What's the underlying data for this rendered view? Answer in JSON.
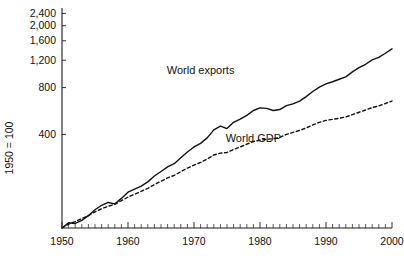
{
  "chart_data": {
    "type": "line",
    "title": "",
    "xlabel": "",
    "ylabel": "1950 = 100",
    "yscale": "log",
    "ylim": [
      100,
      2600
    ],
    "xlim": [
      1950,
      2000
    ],
    "grid": false,
    "legend_position": "inline-annotation",
    "ytick_labels": [
      "2,400",
      "2,000",
      "1,600",
      "1,200",
      "800",
      "400"
    ],
    "ytick_values": [
      2400,
      2000,
      1600,
      1200,
      800,
      400
    ],
    "xtick_labels": [
      "1950",
      "1960",
      "1970",
      "1980",
      "1990",
      "2000"
    ],
    "xtick_values": [
      1950,
      1960,
      1970,
      1980,
      1990,
      2000
    ],
    "x_minor_tick_step": 1,
    "annotations": [
      {
        "text": "World exports",
        "x": 1971,
        "y": 980
      },
      {
        "text": "World GDP",
        "x": 1979,
        "y": 360
      }
    ],
    "series": [
      {
        "name": "World exports",
        "style": "solid",
        "color": "#111111",
        "x": [
          1950,
          1951,
          1952,
          1953,
          1954,
          1955,
          1956,
          1957,
          1958,
          1959,
          1960,
          1961,
          1962,
          1963,
          1964,
          1965,
          1966,
          1967,
          1968,
          1969,
          1970,
          1971,
          1972,
          1973,
          1974,
          1975,
          1976,
          1977,
          1978,
          1979,
          1980,
          1981,
          1982,
          1983,
          1984,
          1985,
          1986,
          1987,
          1988,
          1989,
          1990,
          1991,
          1992,
          1993,
          1994,
          1995,
          1996,
          1997,
          1998,
          1999,
          2000
        ],
        "values": [
          100,
          108,
          107,
          112,
          120,
          131,
          140,
          146,
          143,
          155,
          170,
          178,
          186,
          198,
          216,
          231,
          247,
          259,
          283,
          308,
          332,
          350,
          380,
          428,
          452,
          436,
          478,
          502,
          530,
          570,
          592,
          588,
          570,
          578,
          612,
          628,
          655,
          700,
          755,
          805,
          845,
          872,
          905,
          938,
          1010,
          1075,
          1130,
          1205,
          1250,
          1330,
          1420
        ]
      },
      {
        "name": "World GDP",
        "style": "dashed",
        "color": "#111111",
        "x": [
          1950,
          1951,
          1952,
          1953,
          1954,
          1955,
          1956,
          1957,
          1958,
          1959,
          1960,
          1961,
          1962,
          1963,
          1964,
          1965,
          1966,
          1967,
          1968,
          1969,
          1970,
          1971,
          1972,
          1973,
          1974,
          1975,
          1976,
          1977,
          1978,
          1979,
          1980,
          1981,
          1982,
          1983,
          1984,
          1985,
          1986,
          1987,
          1988,
          1989,
          1990,
          1991,
          1992,
          1993,
          1994,
          1995,
          1996,
          1997,
          1998,
          1999,
          2000
        ],
        "values": [
          100,
          106,
          110,
          115,
          120,
          127,
          133,
          138,
          142,
          150,
          158,
          165,
          172,
          180,
          190,
          200,
          210,
          218,
          230,
          243,
          254,
          264,
          278,
          295,
          303,
          306,
          320,
          332,
          346,
          360,
          367,
          372,
          375,
          383,
          400,
          412,
          424,
          440,
          460,
          478,
          492,
          500,
          508,
          518,
          536,
          555,
          574,
          595,
          610,
          632,
          655
        ]
      }
    ]
  }
}
